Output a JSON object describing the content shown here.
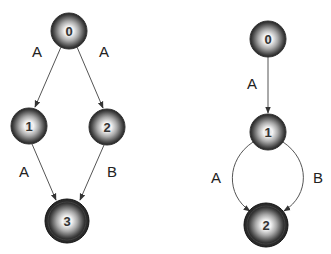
{
  "diagrams": [
    {
      "name": "left-automaton",
      "nodes": [
        {
          "id": "0",
          "label": "0",
          "accepting": false
        },
        {
          "id": "1",
          "label": "1",
          "accepting": false
        },
        {
          "id": "2",
          "label": "2",
          "accepting": false
        },
        {
          "id": "3",
          "label": "3",
          "accepting": true
        }
      ],
      "edges": [
        {
          "from": "0",
          "to": "1",
          "label": "A"
        },
        {
          "from": "0",
          "to": "2",
          "label": "A"
        },
        {
          "from": "1",
          "to": "3",
          "label": "A"
        },
        {
          "from": "2",
          "to": "3",
          "label": "B"
        }
      ]
    },
    {
      "name": "right-automaton",
      "nodes": [
        {
          "id": "0",
          "label": "0",
          "accepting": false
        },
        {
          "id": "1",
          "label": "1",
          "accepting": false
        },
        {
          "id": "2",
          "label": "2",
          "accepting": true
        }
      ],
      "edges": [
        {
          "from": "0",
          "to": "1",
          "label": "A"
        },
        {
          "from": "1",
          "to": "2",
          "label": "A"
        },
        {
          "from": "1",
          "to": "2",
          "label": "B"
        }
      ]
    }
  ]
}
